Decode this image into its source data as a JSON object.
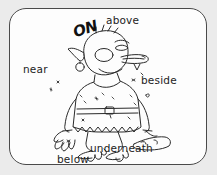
{
  "page": {
    "background_color": "#ebebeb",
    "card_background_color": "#fdfdfd",
    "border_color": "#4a4a4a",
    "ink_color": "#1c1c1c"
  },
  "illustration": {
    "subject": "cartoon troll character standing with large bare feet",
    "alt_text": "Line drawing of a cartoon ogre or troll standing, wearing a belted tunic, with a club lying on the ground beside its right foot"
  },
  "labels": [
    {
      "id": "on",
      "text": "ON",
      "style": "handwritten-bold"
    },
    {
      "id": "above",
      "text": "above",
      "style": "plain"
    },
    {
      "id": "near",
      "text": "near",
      "style": "plain"
    },
    {
      "id": "beside",
      "text": "beside",
      "style": "plain"
    },
    {
      "id": "underneath",
      "text": "underneath",
      "style": "plain"
    },
    {
      "id": "below",
      "text": "below",
      "style": "plain"
    }
  ]
}
